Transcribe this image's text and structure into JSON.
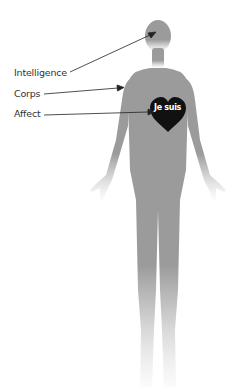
{
  "diagram": {
    "labels": [
      {
        "text": "Intelligence",
        "target": "head"
      },
      {
        "text": "Corps",
        "target": "body"
      },
      {
        "text": "Affect",
        "target": "heart"
      }
    ],
    "heart_text": "Je suis",
    "colors": {
      "figure": "#9b9b9b",
      "heart": "#111111",
      "arrow": "#222222",
      "label": "#333333",
      "background": "#ffffff"
    }
  }
}
